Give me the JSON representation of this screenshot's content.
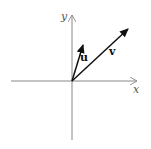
{
  "diagram": {
    "axes": {
      "x_label": "x",
      "y_label": "y"
    },
    "vectors": [
      {
        "name": "u",
        "label": "u"
      },
      {
        "name": "v",
        "label": "v"
      }
    ],
    "colors": {
      "axis": "#888888",
      "vector": "#111111",
      "background": "#ffffff"
    }
  }
}
